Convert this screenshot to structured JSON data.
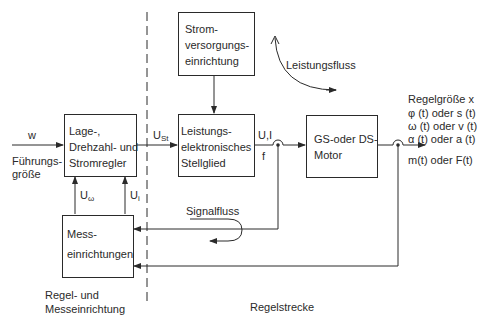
{
  "diagram": {
    "sections": {
      "left_label": [
        "Regel- und",
        "Messeinrichtung"
      ],
      "right_label": "Regelstrecke"
    },
    "blocks": {
      "power_supply": [
        "Strom-",
        "versorgungs-",
        "einrichtung"
      ],
      "controller": [
        "Lage-,",
        "Drehzahl- und",
        "Stromregler"
      ],
      "power_electronics": [
        "Leistungs-",
        "elektronisches",
        "Stellglied"
      ],
      "motor": [
        "GS-oder DS-",
        "Motor"
      ],
      "measurement": [
        "Mess-",
        "einrichtungen"
      ]
    },
    "signals": {
      "input_symbol": "w",
      "input_label": [
        "Führungs-",
        "größe"
      ],
      "control_voltage_main": "U",
      "control_voltage_sub": "St",
      "power_output_top": "U,I",
      "power_output_bottom": "f",
      "feedback_speed_main": "U",
      "feedback_speed_sub": "ω",
      "feedback_current_main": "U",
      "feedback_current_sub": "i"
    },
    "output": {
      "title": "Regelgröße x",
      "lines": [
        "φ (t) oder s (t)",
        "ω (t) oder v (t)",
        "α (t) oder a (t)",
        "m(t) oder F(t)"
      ]
    },
    "flows": {
      "power_flow": "Leistungsfluss",
      "signal_flow": "Signalfluss"
    },
    "colors": {
      "line": "#2a2a2a",
      "background": "#ffffff"
    }
  }
}
